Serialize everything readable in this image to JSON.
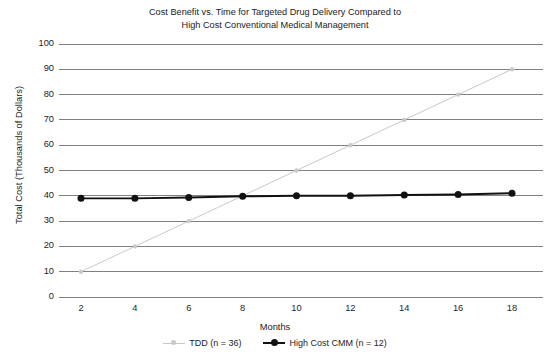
{
  "chart_data": {
    "type": "line",
    "title": "Cost Benefit vs. Time for Targeted Drug Delivery Compared to High Cost Conventional Medical Management",
    "title_line1": "Cost Benefit vs. Time for Targeted Drug Delivery Compared to",
    "title_line2": "High Cost Conventional Medical Management",
    "xlabel": "Months",
    "ylabel": "Total Cost (Thousands of Dollars)",
    "x": [
      2,
      4,
      6,
      8,
      10,
      12,
      14,
      16,
      18
    ],
    "xtick_labels": [
      "2",
      "4",
      "6",
      "8",
      "10",
      "12",
      "14",
      "16",
      "18"
    ],
    "ytick_labels": [
      "100",
      "90",
      "80",
      "70",
      "60",
      "50",
      "40",
      "30",
      "20",
      "10",
      "0"
    ],
    "yticks": [
      100,
      90,
      80,
      70,
      60,
      50,
      40,
      30,
      20,
      10,
      0
    ],
    "xlim": [
      2,
      18
    ],
    "ylim": [
      0,
      100
    ],
    "grid": "horizontal",
    "legend_position": "bottom-center",
    "series": [
      {
        "name": "TDD (n = 36)",
        "short_name": "TDD",
        "color": "#c9c9c9",
        "marker": "circle",
        "values": [
          10,
          20,
          30,
          40,
          50,
          60,
          70,
          80,
          90
        ]
      },
      {
        "name": "High Cost CMM (n = 12)",
        "short_name": "High Cost CMM",
        "color": "#111111",
        "marker": "circle",
        "values": [
          39,
          39,
          39.3,
          39.8,
          40,
          40,
          40.3,
          40.5,
          41
        ]
      }
    ]
  },
  "legend": {
    "items": [
      {
        "label": "TDD (n = 36)",
        "color": "#c9c9c9"
      },
      {
        "label": "High Cost CMM (n = 12)",
        "color": "#111111"
      }
    ]
  },
  "colors": {
    "background": "#ffffff",
    "gridline": "#808080",
    "tdd": "#c9c9c9",
    "cmm": "#111111",
    "text": "#1d1d1d"
  }
}
